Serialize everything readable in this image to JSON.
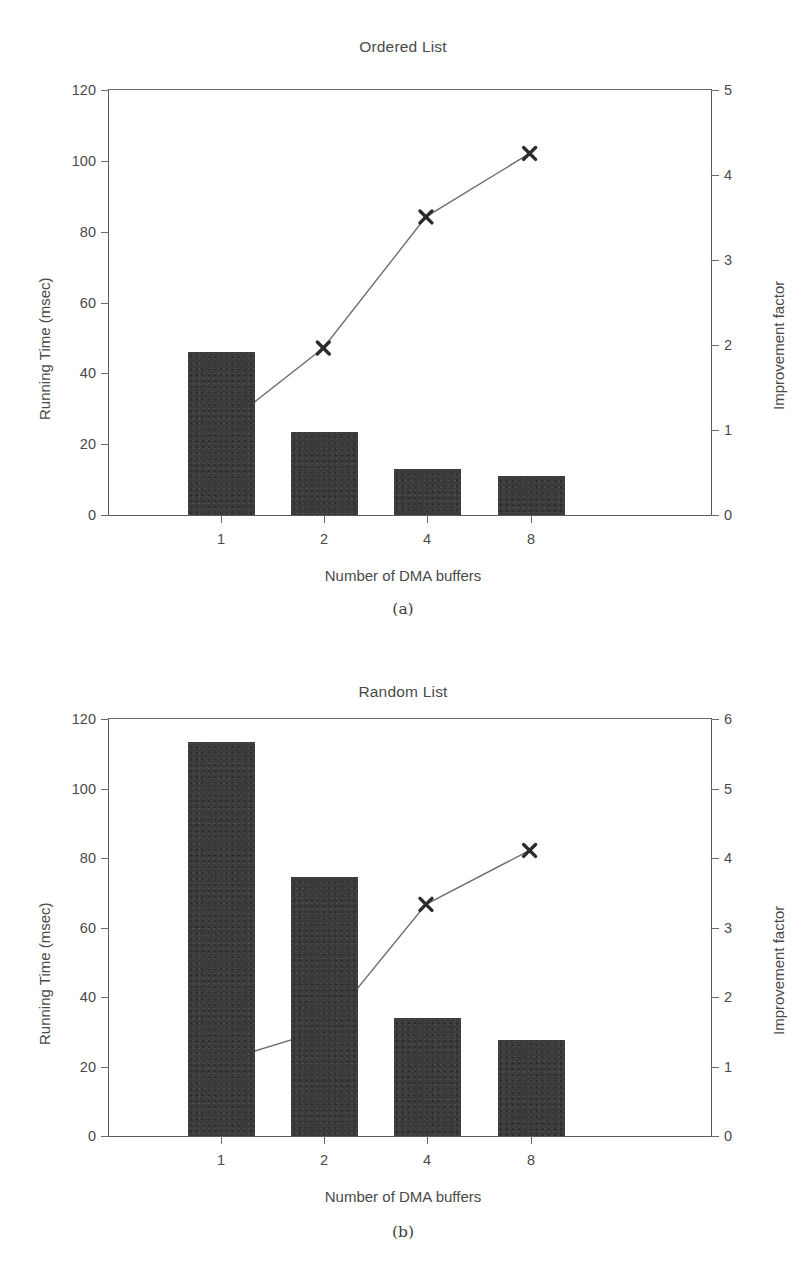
{
  "figure": {
    "panels": [
      {
        "caption": "(a)",
        "chart_data": {
          "type": "bar",
          "title": "Ordered List",
          "xlabel": "Number of DMA buffers",
          "ylabel": "Running Time (msec)",
          "y2label": "Improvement factor",
          "categories": [
            "1",
            "2",
            "4",
            "8"
          ],
          "values": [
            46,
            23.5,
            13,
            11
          ],
          "ylim": [
            0,
            120
          ],
          "yticks": [
            0,
            20,
            40,
            60,
            80,
            100,
            120
          ],
          "y2lim": [
            0,
            5
          ],
          "y2ticks": [
            0,
            1,
            2,
            3,
            4,
            5
          ],
          "grid": false,
          "legend": "none",
          "series": [
            {
              "name": "Running Time (msec)",
              "type": "bar",
              "axis": "left",
              "values": [
                46,
                23.5,
                13,
                11
              ]
            },
            {
              "name": "Improvement factor",
              "type": "line",
              "axis": "right",
              "marker": "x",
              "values": [
                1.0,
                1.95,
                3.5,
                4.25
              ]
            }
          ]
        }
      },
      {
        "caption": "(b)",
        "chart_data": {
          "type": "bar",
          "title": "Random List",
          "xlabel": "Number of DMA buffers",
          "ylabel": "Running Time (msec)",
          "y2label": "Improvement factor",
          "categories": [
            "1",
            "2",
            "4",
            "8"
          ],
          "values": [
            113.5,
            74.5,
            34,
            27.5
          ],
          "ylim": [
            0,
            120
          ],
          "yticks": [
            0,
            20,
            40,
            60,
            80,
            100,
            120
          ],
          "y2lim": [
            0,
            6
          ],
          "y2ticks": [
            0,
            1,
            2,
            3,
            4,
            5,
            6
          ],
          "grid": false,
          "legend": "none",
          "series": [
            {
              "name": "Running Time (msec)",
              "type": "bar",
              "axis": "left",
              "values": [
                113.5,
                74.5,
                34,
                27.5
              ]
            },
            {
              "name": "Improvement factor",
              "type": "line",
              "axis": "right",
              "marker": "x",
              "values": [
                1.05,
                1.5,
                3.32,
                4.1
              ]
            }
          ]
        }
      }
    ]
  },
  "style": {
    "bar_color": "#3b3b3b",
    "line_color": "#6e6e6e",
    "marker_color": "#2b2b2b",
    "axis_color": "#5a5a5a",
    "text_color": "#4a4a4a",
    "background": "#ffffff"
  }
}
